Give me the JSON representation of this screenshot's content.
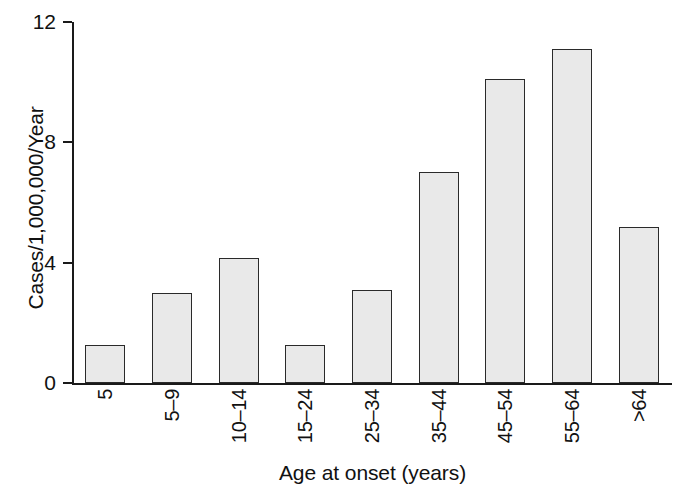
{
  "chart_data": {
    "type": "bar",
    "title": "",
    "xlabel": "Age at onset (years)",
    "ylabel": "Cases/1,000,000/Year",
    "categories": [
      "5",
      "5–9",
      "10–14",
      "15–24",
      "25–34",
      "35–44",
      "45–54",
      "55–64",
      ">64"
    ],
    "values": [
      1.25,
      3.0,
      4.15,
      1.25,
      3.1,
      7.0,
      10.1,
      11.1,
      5.2
    ],
    "ylim": [
      0,
      12
    ],
    "yticks": [
      0,
      4,
      8,
      12
    ],
    "ytick_labels": [
      "0",
      "4",
      "8",
      "12"
    ],
    "grid": false,
    "legend": false,
    "bar_fill": "#e9e9e9",
    "bar_edge": "#2a2a2a",
    "axis_color": "#1a1a1a",
    "background": "#ffffff"
  }
}
